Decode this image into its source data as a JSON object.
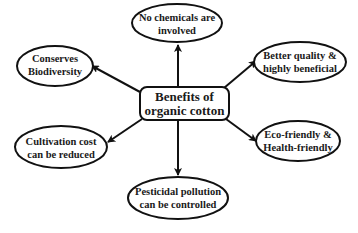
{
  "diagram": {
    "type": "mind-map",
    "center": {
      "id": "center",
      "lines": [
        "Benefits of",
        "organic cotton"
      ],
      "shape": "rounded-rectangle"
    },
    "nodes": [
      {
        "id": "no-chemicals",
        "lines": [
          "No chemicals are",
          "involved"
        ],
        "shape": "ellipse",
        "position": "top"
      },
      {
        "id": "conserves-biodiversity",
        "lines": [
          "Conserves",
          "Biodiversity"
        ],
        "shape": "ellipse",
        "position": "upper-left"
      },
      {
        "id": "better-quality",
        "lines": [
          "Better quality &",
          "highly beneficial"
        ],
        "shape": "ellipse",
        "position": "upper-right"
      },
      {
        "id": "cultivation-cost",
        "lines": [
          "Cultivation cost",
          "can be reduced"
        ],
        "shape": "ellipse",
        "position": "lower-left"
      },
      {
        "id": "eco-friendly",
        "lines": [
          "Eco-friendly &",
          "Health-friendly"
        ],
        "shape": "ellipse",
        "position": "lower-right"
      },
      {
        "id": "pesticidal-pollution",
        "lines": [
          "Pesticidal pollution",
          "can be controlled"
        ],
        "shape": "ellipse",
        "position": "bottom"
      }
    ],
    "edges": [
      {
        "from": "center",
        "to": "no-chemicals",
        "arrow": "to"
      },
      {
        "from": "center",
        "to": "conserves-biodiversity",
        "arrow": "to"
      },
      {
        "from": "center",
        "to": "better-quality",
        "arrow": "to"
      },
      {
        "from": "center",
        "to": "cultivation-cost",
        "arrow": "to"
      },
      {
        "from": "center",
        "to": "eco-friendly",
        "arrow": "to"
      },
      {
        "from": "center",
        "to": "pesticidal-pollution",
        "arrow": "to"
      }
    ],
    "colors": {
      "stroke": "#111111",
      "fill": "#ffffff",
      "text": "#1a1a1a",
      "background": "#ffffff"
    }
  }
}
